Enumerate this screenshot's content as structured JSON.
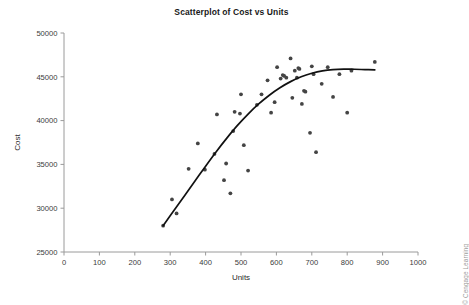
{
  "chart_data": {
    "type": "scatter",
    "title": "Scatterplot of Cost vs Units",
    "xlabel": "Units",
    "ylabel": "Cost",
    "xlim": [
      0,
      1000
    ],
    "ylim": [
      25000,
      50000
    ],
    "xticks": [
      0,
      100,
      200,
      300,
      400,
      500,
      600,
      700,
      800,
      900,
      1000
    ],
    "yticks": [
      25000,
      30000,
      35000,
      40000,
      45000,
      50000
    ],
    "grid": false,
    "legend": null,
    "marker_color": "#444444",
    "fit_color": "#111111",
    "axis_color": "#9a9a9a",
    "points": [
      [
        280,
        28000
      ],
      [
        305,
        31000
      ],
      [
        318,
        29400
      ],
      [
        352,
        34500
      ],
      [
        378,
        37400
      ],
      [
        398,
        34400
      ],
      [
        425,
        36200
      ],
      [
        432,
        40700
      ],
      [
        452,
        33200
      ],
      [
        458,
        35100
      ],
      [
        470,
        31700
      ],
      [
        478,
        38800
      ],
      [
        482,
        41000
      ],
      [
        497,
        40800
      ],
      [
        500,
        43000
      ],
      [
        508,
        37200
      ],
      [
        520,
        34300
      ],
      [
        545,
        41800
      ],
      [
        558,
        43000
      ],
      [
        575,
        44600
      ],
      [
        585,
        40900
      ],
      [
        595,
        42100
      ],
      [
        602,
        46100
      ],
      [
        612,
        44800
      ],
      [
        618,
        45200
      ],
      [
        622,
        45100
      ],
      [
        628,
        44900
      ],
      [
        640,
        47100
      ],
      [
        645,
        42600
      ],
      [
        652,
        45700
      ],
      [
        658,
        44900
      ],
      [
        662,
        46000
      ],
      [
        665,
        45900
      ],
      [
        672,
        41900
      ],
      [
        678,
        43400
      ],
      [
        682,
        43300
      ],
      [
        695,
        38600
      ],
      [
        700,
        46200
      ],
      [
        705,
        45300
      ],
      [
        712,
        36400
      ],
      [
        728,
        44200
      ],
      [
        745,
        46100
      ],
      [
        760,
        42700
      ],
      [
        778,
        45300
      ],
      [
        800,
        40900
      ],
      [
        812,
        45700
      ],
      [
        878,
        46700
      ]
    ],
    "fit_curve": [
      [
        280,
        28000
      ],
      [
        310,
        29700
      ],
      [
        340,
        31400
      ],
      [
        370,
        33100
      ],
      [
        400,
        34800
      ],
      [
        430,
        36450
      ],
      [
        460,
        38000
      ],
      [
        490,
        39450
      ],
      [
        520,
        40750
      ],
      [
        550,
        41900
      ],
      [
        580,
        42900
      ],
      [
        610,
        43750
      ],
      [
        640,
        44450
      ],
      [
        670,
        45000
      ],
      [
        700,
        45400
      ],
      [
        730,
        45680
      ],
      [
        760,
        45830
      ],
      [
        790,
        45880
      ],
      [
        820,
        45860
      ],
      [
        850,
        45820
      ],
      [
        878,
        45790
      ]
    ]
  },
  "credit": {
    "text": "© Cengage Learning"
  }
}
